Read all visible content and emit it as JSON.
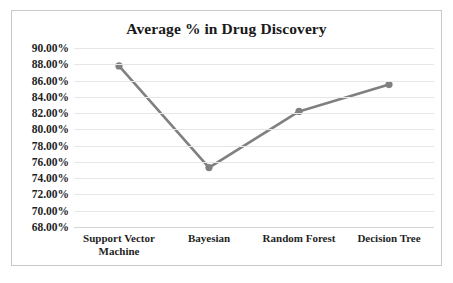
{
  "chart_data": {
    "type": "line",
    "title": "Average % in Drug Discovery",
    "xlabel": "",
    "ylabel": "",
    "categories": [
      "Support Vector Machine",
      "Bayesian",
      "Random Forest",
      "Decision Tree"
    ],
    "category_lines": [
      [
        "Support Vector",
        "Machine"
      ],
      [
        "Bayesian"
      ],
      [
        "Random Forest"
      ],
      [
        "Decision Tree"
      ]
    ],
    "values": [
      87.8,
      75.3,
      82.2,
      85.5
    ],
    "value_labels": [
      "87.80%",
      "75.30%",
      "82.20%",
      "85.50%"
    ],
    "series": [
      {
        "name": "Average %",
        "values": [
          87.8,
          75.3,
          82.2,
          85.5
        ]
      }
    ],
    "ylim": [
      68,
      90
    ],
    "ytick_step": 2,
    "ytick_labels": [
      "90.00%",
      "88.00%",
      "86.00%",
      "84.00%",
      "82.00%",
      "80.00%",
      "78.00%",
      "76.00%",
      "74.00%",
      "72.00%",
      "70.00%",
      "68.00%"
    ],
    "ytick_values": [
      90,
      88,
      86,
      84,
      82,
      80,
      78,
      76,
      74,
      72,
      70,
      68
    ],
    "grid": true,
    "grid_axis": "y",
    "legend": false,
    "legend_position": "none",
    "marker": "circle",
    "colors": {
      "line": "#808080",
      "marker": "#808080",
      "gridline": "#e6e6e6",
      "axis": "#d4d4d4",
      "text": "#1f1f1f",
      "title": "#1a1a1a",
      "background": "#ffffff",
      "border": "#c9c9c9"
    }
  }
}
